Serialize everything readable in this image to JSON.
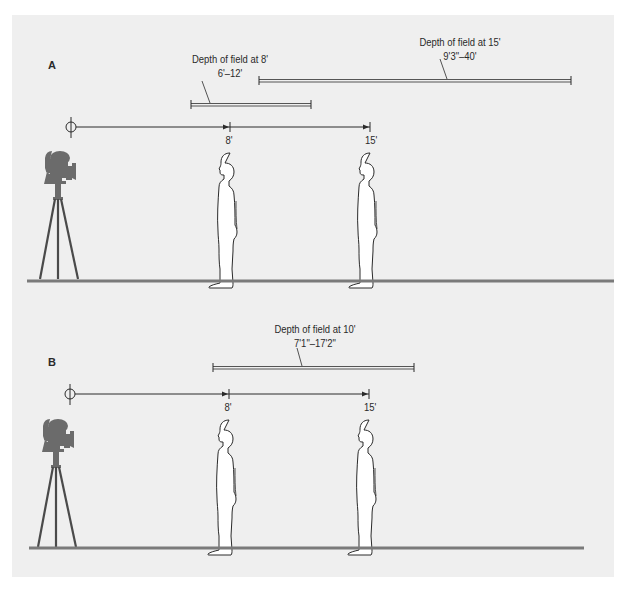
{
  "figure": {
    "top_clipped_text": "Depth of field range diagram",
    "colors": {
      "panel_bg": "#efefef",
      "ground": "#7a7a7a",
      "line": "#333333",
      "camera": "#6b6b6b",
      "figure_fill": "#ffffff",
      "dof_bar": "#555555"
    }
  },
  "panels": [
    {
      "letter": "A",
      "distance_marks": [
        {
          "label": "8'",
          "x": 230
        },
        {
          "label": "15'",
          "x": 370
        }
      ],
      "dof_ranges": [
        {
          "title": "Depth of field at 8'",
          "range": "6'–12'",
          "x1": 191,
          "x2": 311
        },
        {
          "title": "Depth of field at 15'",
          "range": "9'3\"–40'",
          "x1": 259,
          "x2": 571
        }
      ]
    },
    {
      "letter": "B",
      "distance_marks": [
        {
          "label": "8'",
          "x": 229
        },
        {
          "label": "15'",
          "x": 369
        }
      ],
      "dof_ranges": [
        {
          "title": "Depth of field at 10'",
          "range": "7'1\"–17'2\"",
          "x1": 213,
          "x2": 414
        }
      ]
    }
  ]
}
